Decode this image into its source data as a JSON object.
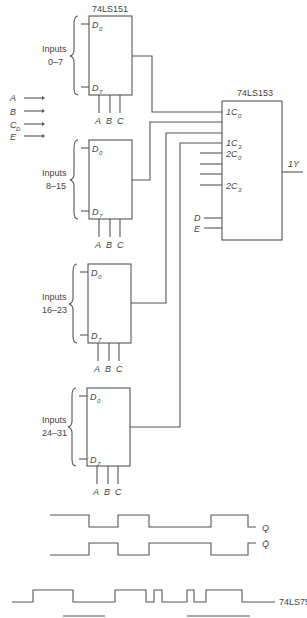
{
  "mux151": {
    "title": "74LS151",
    "pin_top": "D",
    "pin_top_sub": "0",
    "pin_bottom": "D",
    "pin_bottom_sub": "7",
    "select": [
      "A",
      "B",
      "C"
    ],
    "groups": [
      {
        "label": "Inputs",
        "range": "0–7"
      },
      {
        "label": "Inputs",
        "range": "8–15"
      },
      {
        "label": "Inputs",
        "range": "16–23"
      },
      {
        "label": "Inputs",
        "range": "24–31"
      }
    ]
  },
  "external_inputs": [
    {
      "name": "A",
      "sub": ""
    },
    {
      "name": "B",
      "sub": ""
    },
    {
      "name": "C",
      "sub": "D"
    },
    {
      "name": "E",
      "sub": ""
    }
  ],
  "mux153": {
    "title": "74LS153",
    "pins": [
      {
        "pre": "1C",
        "sub": "0"
      },
      {
        "pre": "1C",
        "sub": "3"
      },
      {
        "pre": "2C",
        "sub": "0"
      },
      {
        "pre": "2C",
        "sub": "3"
      }
    ],
    "control": [
      "D",
      "E"
    ],
    "output": "1Y"
  },
  "waveforms": {
    "q_label": "Q",
    "qbar_label": "Q̄",
    "bottom_label": "74LS75"
  }
}
